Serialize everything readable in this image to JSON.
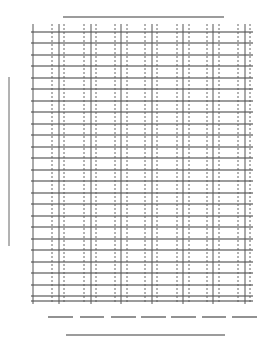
{
  "page": {
    "width": 273,
    "height": 343,
    "background": "#ffffff",
    "ink": "#3a3a3a"
  },
  "title_line": {
    "x1": 63,
    "x2": 224,
    "y": 17
  },
  "side_label_line": {
    "x": 9,
    "y1": 77,
    "y2": 246
  },
  "grid": {
    "left": 31,
    "right": 253,
    "top": 24,
    "bottom": 304,
    "rows_y": [
      32,
      43,
      55,
      66,
      78,
      89,
      101,
      112,
      124,
      135,
      147,
      158,
      170,
      181,
      193,
      204,
      216,
      227,
      239,
      250,
      262,
      273,
      285,
      296
    ],
    "bottom_edge_y": 301,
    "solid_columns_x": [
      33,
      59,
      91,
      121,
      152,
      183,
      213,
      245
    ],
    "dashed_columns_x": [
      52,
      64,
      84,
      96,
      115,
      127,
      145,
      157,
      177,
      189,
      207,
      219,
      238,
      250
    ]
  },
  "footer_blanks": {
    "y": 317,
    "segments": [
      [
        48,
        73
      ],
      [
        80,
        104
      ],
      [
        111,
        136
      ],
      [
        141,
        166
      ],
      [
        171,
        196
      ],
      [
        202,
        226
      ],
      [
        232,
        257
      ]
    ]
  },
  "signature_line": {
    "x1": 66,
    "x2": 225,
    "y": 335
  }
}
